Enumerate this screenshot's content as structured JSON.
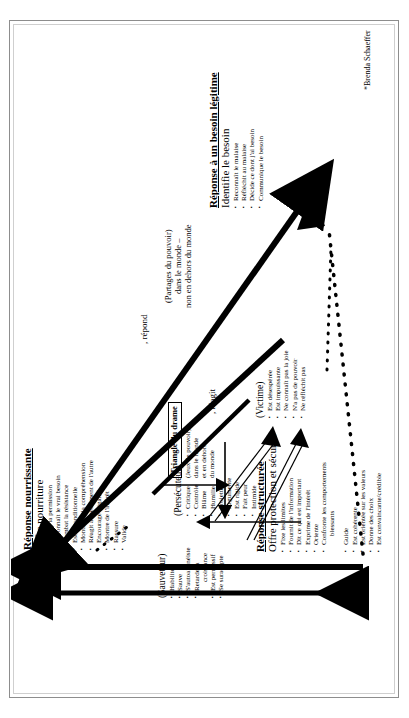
{
  "document": {
    "credit": "*Brenda Schaeffer",
    "verbs": {
      "reagit": ", réagit",
      "repond": ", répond"
    },
    "power_note": [
      "(Partages du pouvoir)",
      "dans le monde –",
      "non en dehors du monde"
    ]
  },
  "drama_triangle": {
    "label_lines": [
      "Triangle du drame"
    ],
    "sub_lines": [
      "(Jeux de pouvoir)",
      "dans le monde",
      "et en dehors",
      "du monde"
    ]
  },
  "roles": [
    {
      "name": "(Persécuteur)",
      "items": [
        "Critique",
        "Contrôle",
        "Blâme",
        "Humilie",
        "Projette",
        "Argumente",
        "Est rigide",
        "Fait peur",
        "Intimide"
      ]
    },
    {
      "name": "(Sauveteur)",
      "items": [
        "Habilite",
        "Sauve",
        "S'autoaliénéiste",
        "Retarde la",
        "croissance",
        "Est permissif",
        "Se suradapte"
      ]
    },
    {
      "name": "(Victime)",
      "items": [
        "Est désespérée",
        "Est impuissante",
        "Ne connaît pas la joie",
        "N'a pas de pouvoir",
        "Ne réfléchit pas"
      ]
    }
  ],
  "responses": [
    {
      "id": "nourrissante",
      "title": "Réponse nourrissante",
      "subtitle": "Offre nourriture",
      "items": [
        "Donne la permission",
        "Reconnaît le vrai besoin",
        "Combat la résistance",
        "Est inconditionnelle",
        "Montre de la compréhension",
        "Réagit au sentiment de l'autre",
        "Encourage l'égalité",
        "Montre de l'intérêt",
        "Rassure",
        "Valide"
      ]
    },
    {
      "id": "structuree",
      "title": "Réponse structurée",
      "subtitle": "Offre protection et sécurité",
      "items": [
        "Fixe les limites",
        "Fournit de l'information",
        "Dit ce qui est important",
        "Exprime de l'intérêt",
        "Oriente",
        "Confronte les comportements",
        "blessants",
        "Guide",
        "Est cohérente",
        "Est orientée sur les valeurs",
        "Donne des choix",
        "Est convaincante/crédible"
      ]
    },
    {
      "id": "besoin",
      "title": "Réponse à un besoin légitime",
      "subtitle": "Identifie le besoin",
      "items": [
        "Reconnaît le malaise",
        "Réfléchit au malaise",
        "Décide ce dont j'ai besoin",
        "Communique le besoin"
      ]
    }
  ]
}
